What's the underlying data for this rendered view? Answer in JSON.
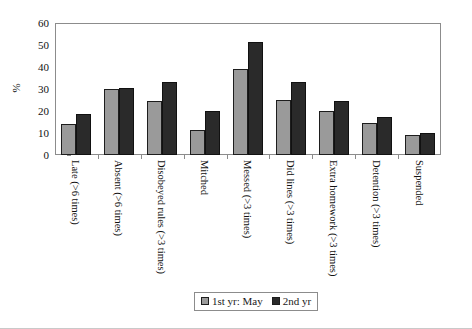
{
  "chart_data": {
    "type": "bar",
    "title": "",
    "xlabel": "",
    "ylabel": "%",
    "ylim": [
      0,
      60
    ],
    "yticks": [
      0,
      10,
      20,
      30,
      40,
      50,
      60
    ],
    "grid": false,
    "legend_position": "bottom-center",
    "categories": [
      "Late (>6 times)",
      "Absent (>6 times)",
      "Disobeyed rules (>3 times)",
      "Mitched",
      "Messed (>3 times)",
      "Did lines (>3 times)",
      "Extra homework (>3 times)",
      "Detention (>3 times)",
      "Suspended"
    ],
    "series": [
      {
        "name": "1st yr: May",
        "color": "#9a9a9a",
        "values": [
          14,
          30,
          24.5,
          11.5,
          39,
          25,
          20,
          14.5,
          9
        ]
      },
      {
        "name": "2nd yr",
        "color": "#2a2a2a",
        "values": [
          18.5,
          30.5,
          33,
          20,
          51.5,
          33,
          24.5,
          17.5,
          10
        ]
      }
    ]
  },
  "axis": {
    "y_title": "%",
    "y_tick_labels": [
      "60",
      "50",
      "40",
      "30",
      "20",
      "10",
      "0"
    ]
  },
  "legend": {
    "entries": [
      {
        "label": "1st yr: May"
      },
      {
        "label": "2nd yr"
      }
    ]
  },
  "colors": {
    "series_1": "#9a9a9a",
    "series_2": "#2a2a2a",
    "axis_line": "#8c8c8c",
    "bar_outline": "#1d1d1d",
    "background": "#ffffff"
  }
}
